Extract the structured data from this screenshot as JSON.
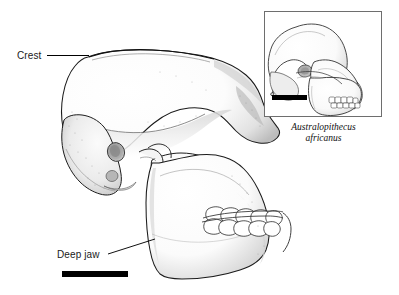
{
  "figure": {
    "kind": "scientific-illustration",
    "background_color": "#ffffff",
    "line_color": "#000000",
    "shading_color": "#9a9a9a",
    "width": 399,
    "height": 295
  },
  "labels": {
    "crest": "Crest",
    "deep_jaw": "Deep jaw"
  },
  "inset": {
    "caption_genus": "Australopithecus",
    "caption_species": "africanus",
    "border_color": "#6e6e6e"
  },
  "scale_bars": {
    "main_color": "#000000",
    "inset_color": "#000000"
  }
}
